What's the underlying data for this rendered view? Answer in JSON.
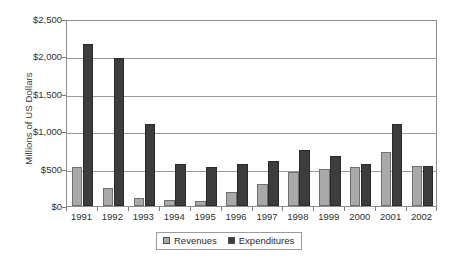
{
  "chart_data": {
    "type": "bar",
    "title": "",
    "xlabel": "",
    "ylabel": "Millions of US Dollars",
    "ylim": [
      0,
      2500
    ],
    "ytick_values": [
      0,
      500,
      1000,
      1500,
      2000,
      2500
    ],
    "ytick_labels": [
      "$0",
      "$500",
      "$1,000",
      "$1,500",
      "$2,000",
      "$2,500"
    ],
    "grid": true,
    "legend_position": "bottom-center",
    "categories": [
      "1991",
      "1992",
      "1993",
      "1994",
      "1995",
      "1996",
      "1997",
      "1998",
      "1999",
      "2000",
      "2001",
      "2002"
    ],
    "series": [
      {
        "name": "Revenues",
        "color": "#a9a9a9",
        "values": [
          520,
          245,
          105,
          75,
          65,
          190,
          300,
          450,
          490,
          520,
          720,
          530
        ]
      },
      {
        "name": "Expenditures",
        "color": "#3d3d3d",
        "values": [
          2160,
          1980,
          1100,
          560,
          520,
          560,
          605,
          745,
          670,
          560,
          1100,
          530
        ]
      }
    ]
  },
  "legend": {
    "items": [
      {
        "label": "Revenues",
        "swatch": "revenues"
      },
      {
        "label": "Expenditures",
        "swatch": "expenditures"
      }
    ]
  }
}
